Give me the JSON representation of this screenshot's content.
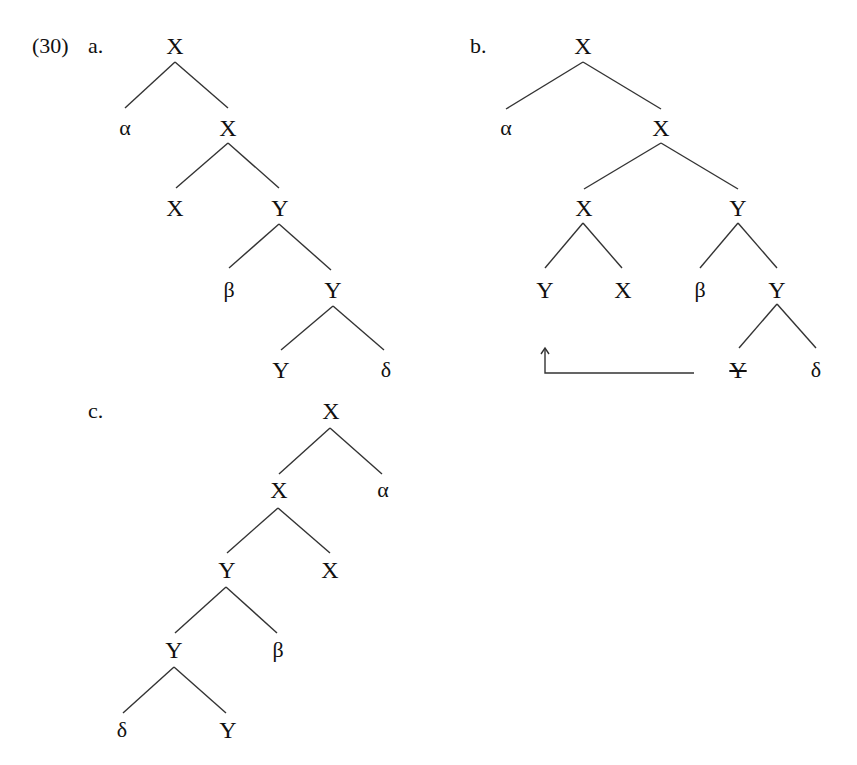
{
  "example": {
    "number": "(30)",
    "trees": [
      {
        "label": "a.",
        "nodes": [
          {
            "id": "a0",
            "text": "X",
            "x": 175,
            "y": 45
          },
          {
            "id": "a1",
            "text": "α",
            "x": 125,
            "y": 128
          },
          {
            "id": "a2",
            "text": "X",
            "x": 228,
            "y": 128
          },
          {
            "id": "a3",
            "text": "X",
            "x": 175,
            "y": 208
          },
          {
            "id": "a4",
            "text": "Y",
            "x": 280,
            "y": 208
          },
          {
            "id": "a5",
            "text": "β",
            "x": 229,
            "y": 290
          },
          {
            "id": "a6",
            "text": "Y",
            "x": 333,
            "y": 290
          },
          {
            "id": "a7",
            "text": "Y",
            "x": 281,
            "y": 370
          },
          {
            "id": "a8",
            "text": "δ",
            "x": 386,
            "y": 370
          }
        ],
        "edges": [
          [
            "a0",
            "a1"
          ],
          [
            "a0",
            "a2"
          ],
          [
            "a2",
            "a3"
          ],
          [
            "a2",
            "a4"
          ],
          [
            "a4",
            "a5"
          ],
          [
            "a4",
            "a6"
          ],
          [
            "a6",
            "a7"
          ],
          [
            "a6",
            "a8"
          ]
        ]
      },
      {
        "label": "b.",
        "nodes": [
          {
            "id": "b0",
            "text": "X",
            "x": 583,
            "y": 45
          },
          {
            "id": "b1",
            "text": "α",
            "x": 506,
            "y": 128
          },
          {
            "id": "b2",
            "text": "X",
            "x": 661,
            "y": 128
          },
          {
            "id": "b3",
            "text": "X",
            "x": 584,
            "y": 208
          },
          {
            "id": "b4",
            "text": "Y",
            "x": 738,
            "y": 208
          },
          {
            "id": "b5",
            "text": "Y",
            "x": 545,
            "y": 290
          },
          {
            "id": "b6",
            "text": "X",
            "x": 623,
            "y": 290
          },
          {
            "id": "b7",
            "text": "β",
            "x": 700,
            "y": 290
          },
          {
            "id": "b8",
            "text": "Y",
            "x": 777,
            "y": 290
          },
          {
            "id": "b9",
            "text": "Y",
            "x": 738,
            "y": 370,
            "struck": true
          },
          {
            "id": "b10",
            "text": "δ",
            "x": 816,
            "y": 370
          }
        ],
        "edges": [
          [
            "b0",
            "b1"
          ],
          [
            "b0",
            "b2"
          ],
          [
            "b2",
            "b3"
          ],
          [
            "b2",
            "b4"
          ],
          [
            "b3",
            "b5"
          ],
          [
            "b3",
            "b6"
          ],
          [
            "b4",
            "b7"
          ],
          [
            "b4",
            "b8"
          ],
          [
            "b8",
            "b9"
          ],
          [
            "b8",
            "b10"
          ]
        ],
        "movement_arrow": {
          "from": "Y (struck, trace position)",
          "to": "Y (sister of X)"
        }
      },
      {
        "label": "c.",
        "nodes": [
          {
            "id": "c0",
            "text": "X",
            "x": 331,
            "y": 410
          },
          {
            "id": "c1",
            "text": "X",
            "x": 279,
            "y": 490
          },
          {
            "id": "c2",
            "text": "α",
            "x": 383,
            "y": 490
          },
          {
            "id": "c3",
            "text": "Y",
            "x": 227,
            "y": 570
          },
          {
            "id": "c4",
            "text": "X",
            "x": 330,
            "y": 570
          },
          {
            "id": "c5",
            "text": "Y",
            "x": 174,
            "y": 650
          },
          {
            "id": "c6",
            "text": "β",
            "x": 278,
            "y": 650
          },
          {
            "id": "c7",
            "text": "δ",
            "x": 122,
            "y": 730
          },
          {
            "id": "c8",
            "text": "Y",
            "x": 228,
            "y": 730
          }
        ],
        "edges": [
          [
            "c0",
            "c1"
          ],
          [
            "c0",
            "c2"
          ],
          [
            "c1",
            "c3"
          ],
          [
            "c1",
            "c4"
          ],
          [
            "c3",
            "c5"
          ],
          [
            "c3",
            "c6"
          ],
          [
            "c5",
            "c7"
          ],
          [
            "c5",
            "c8"
          ]
        ]
      }
    ]
  },
  "labels": {
    "a": {
      "number": "(30)",
      "letter": "a."
    },
    "b": {
      "letter": "b."
    },
    "c": {
      "letter": "c."
    }
  },
  "nodes": {
    "a0": "X",
    "a1": "α",
    "a2": "X",
    "a3": "X",
    "a4": "Y",
    "a5": "β",
    "a6": "Y",
    "a7": "Y",
    "a8": "δ",
    "b0": "X",
    "b1": "α",
    "b2": "X",
    "b3": "X",
    "b4": "Y",
    "b5": "Y",
    "b6": "X",
    "b7": "β",
    "b8": "Y",
    "b9": "Y",
    "b10": "δ",
    "c0": "X",
    "c1": "X",
    "c2": "α",
    "c3": "Y",
    "c4": "X",
    "c5": "Y",
    "c6": "β",
    "c7": "δ",
    "c8": "Y"
  }
}
